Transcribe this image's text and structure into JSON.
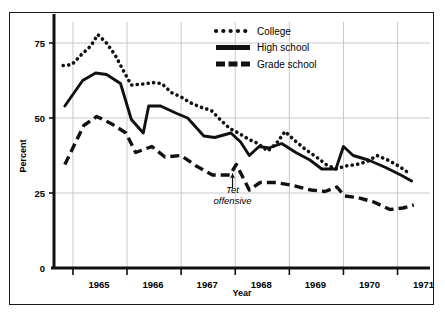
{
  "chart_data": {
    "type": "line",
    "title": "",
    "xlabel": "Year",
    "ylabel": "Percent",
    "xlim": [
      1964.65,
      1971.6
    ],
    "ylim": [
      0,
      82
    ],
    "yticks": [
      0,
      25,
      50,
      75
    ],
    "ytick_labels": [
      "0",
      "25",
      "50",
      "75"
    ],
    "xticks": [
      1965,
      1966,
      1967,
      1968,
      1969,
      1970,
      1971
    ],
    "xtick_labels": [
      "1965",
      "1966",
      "1967",
      "1968",
      "1969",
      "1970",
      "1971"
    ],
    "grid": true,
    "legend_position": "top-center-right",
    "annotations": [
      {
        "text_line1": "Tet",
        "text_line2": "offensive",
        "x": 1967.95,
        "y": 25.5,
        "arrow_to_y": 31.5,
        "style": "italic-with-up-arrow"
      }
    ],
    "series": [
      {
        "name": "College",
        "style": "dotted",
        "color": "#111111",
        "points": [
          [
            1964.82,
            67.5
          ],
          [
            1964.98,
            67.8
          ],
          [
            1965.15,
            71.0
          ],
          [
            1965.33,
            74.0
          ],
          [
            1965.46,
            77.8
          ],
          [
            1965.62,
            75.0
          ],
          [
            1965.78,
            71.0
          ],
          [
            1965.94,
            65.5
          ],
          [
            1966.08,
            61.0
          ],
          [
            1966.28,
            61.3
          ],
          [
            1966.48,
            61.8
          ],
          [
            1966.64,
            61.5
          ],
          [
            1966.82,
            58.5
          ],
          [
            1967.0,
            57.0
          ],
          [
            1967.18,
            55.0
          ],
          [
            1967.38,
            53.5
          ],
          [
            1967.56,
            52.5
          ],
          [
            1967.72,
            49.5
          ],
          [
            1967.9,
            46.5
          ],
          [
            1968.06,
            45.0
          ],
          [
            1968.24,
            43.0
          ],
          [
            1968.42,
            41.5
          ],
          [
            1968.6,
            39.0
          ],
          [
            1968.76,
            41.5
          ],
          [
            1968.92,
            45.5
          ],
          [
            1969.1,
            42.5
          ],
          [
            1969.3,
            39.5
          ],
          [
            1969.5,
            37.0
          ],
          [
            1969.68,
            34.5
          ],
          [
            1969.86,
            33.0
          ],
          [
            1970.04,
            34.0
          ],
          [
            1970.24,
            34.5
          ],
          [
            1970.44,
            35.5
          ],
          [
            1970.62,
            37.5
          ],
          [
            1970.82,
            36.0
          ],
          [
            1971.02,
            34.0
          ],
          [
            1971.22,
            31.5
          ]
        ]
      },
      {
        "name": "High school",
        "style": "solid",
        "color": "#111111",
        "points": [
          [
            1964.85,
            54.0
          ],
          [
            1965.18,
            62.5
          ],
          [
            1965.42,
            65.0
          ],
          [
            1965.62,
            64.5
          ],
          [
            1965.88,
            61.5
          ],
          [
            1966.08,
            49.5
          ],
          [
            1966.3,
            45.0
          ],
          [
            1966.4,
            54.0
          ],
          [
            1966.62,
            54.0
          ],
          [
            1966.92,
            51.5
          ],
          [
            1967.12,
            50.0
          ],
          [
            1967.42,
            44.0
          ],
          [
            1967.62,
            43.5
          ],
          [
            1967.92,
            45.0
          ],
          [
            1968.1,
            42.0
          ],
          [
            1968.26,
            37.5
          ],
          [
            1968.44,
            40.5
          ],
          [
            1968.62,
            40.0
          ],
          [
            1968.86,
            41.5
          ],
          [
            1969.12,
            38.5
          ],
          [
            1969.38,
            36.0
          ],
          [
            1969.6,
            33.0
          ],
          [
            1969.86,
            33.0
          ],
          [
            1970.0,
            40.5
          ],
          [
            1970.18,
            37.5
          ],
          [
            1970.46,
            36.0
          ],
          [
            1970.78,
            33.5
          ],
          [
            1971.06,
            31.0
          ],
          [
            1971.26,
            29.0
          ]
        ]
      },
      {
        "name": "Grade school",
        "style": "dashed",
        "color": "#111111",
        "points": [
          [
            1964.85,
            34.5
          ],
          [
            1965.2,
            47.5
          ],
          [
            1965.44,
            50.5
          ],
          [
            1965.72,
            48.0
          ],
          [
            1965.98,
            45.0
          ],
          [
            1966.16,
            38.5
          ],
          [
            1966.46,
            40.5
          ],
          [
            1966.7,
            37.0
          ],
          [
            1967.0,
            37.5
          ],
          [
            1967.28,
            34.0
          ],
          [
            1967.58,
            31.0
          ],
          [
            1967.9,
            31.0
          ],
          [
            1968.02,
            34.5
          ],
          [
            1968.26,
            26.0
          ],
          [
            1968.46,
            28.5
          ],
          [
            1968.76,
            28.5
          ],
          [
            1969.06,
            27.5
          ],
          [
            1969.4,
            26.0
          ],
          [
            1969.66,
            25.5
          ],
          [
            1969.88,
            27.0
          ],
          [
            1970.02,
            24.0
          ],
          [
            1970.26,
            23.5
          ],
          [
            1970.56,
            22.0
          ],
          [
            1970.86,
            19.5
          ],
          [
            1971.1,
            20.0
          ],
          [
            1971.3,
            21.0
          ]
        ]
      }
    ]
  },
  "legend": {
    "items": [
      {
        "label": "College",
        "style": "dotted"
      },
      {
        "label": "High school",
        "style": "solid"
      },
      {
        "label": "Grade school",
        "style": "dashed"
      }
    ]
  },
  "axes": {
    "y_title": "Percent",
    "x_title": "Year"
  }
}
